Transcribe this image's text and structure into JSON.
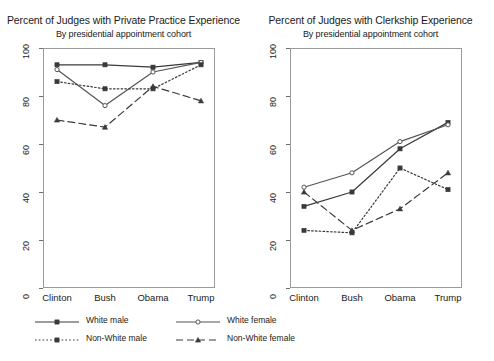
{
  "figure": {
    "panels": [
      {
        "id": "private-practice",
        "title": "Percent of Judges with Private Practice Experience",
        "subtitle": "By presidential appointment cohort"
      },
      {
        "id": "clerkship",
        "title": "Percent of Judges with Clerkship Experience",
        "subtitle": "By presidential appointment cohort"
      }
    ],
    "legend": {
      "entries": [
        {
          "label": "White male",
          "marker": "filled-square",
          "line": "solid",
          "color": "#3a3a3a"
        },
        {
          "label": "White female",
          "marker": "open-circle",
          "line": "solid",
          "color": "#5a5a5a"
        },
        {
          "label": "Non-White male",
          "marker": "filled-square",
          "line": "dotted",
          "color": "#3a3a3a"
        },
        {
          "label": "Non-White female",
          "marker": "filled-triangle",
          "line": "dashed",
          "color": "#3a3a3a"
        }
      ]
    }
  },
  "axes": {
    "y_ticks": [
      "0",
      "20",
      "40",
      "60",
      "80",
      "100"
    ],
    "x_ticks": [
      "Clinton",
      "Bush",
      "Obama",
      "Trump"
    ],
    "ylim": [
      0,
      100
    ]
  },
  "chart_data": [
    {
      "type": "line",
      "title": "Percent of Judges with Private Practice Experience",
      "subtitle": "By presidential appointment cohort",
      "xlabel": "",
      "ylabel": "",
      "categories": [
        "Clinton",
        "Bush",
        "Obama",
        "Trump"
      ],
      "ylim": [
        0,
        100
      ],
      "grid": false,
      "legend_position": "bottom",
      "series": [
        {
          "name": "White male",
          "values": [
            93,
            93,
            92,
            94
          ]
        },
        {
          "name": "White female",
          "values": [
            91,
            76,
            90,
            94
          ]
        },
        {
          "name": "Non-White male",
          "values": [
            86,
            83,
            83,
            93
          ]
        },
        {
          "name": "Non-White female",
          "values": [
            70,
            67,
            84,
            78
          ]
        }
      ]
    },
    {
      "type": "line",
      "title": "Percent of Judges with Clerkship Experience",
      "subtitle": "By presidential appointment cohort",
      "xlabel": "",
      "ylabel": "",
      "categories": [
        "Clinton",
        "Bush",
        "Obama",
        "Trump"
      ],
      "ylim": [
        0,
        100
      ],
      "grid": false,
      "legend_position": "bottom",
      "series": [
        {
          "name": "White male",
          "values": [
            34,
            40,
            58,
            69
          ]
        },
        {
          "name": "White female",
          "values": [
            42,
            48,
            61,
            68
          ]
        },
        {
          "name": "Non-White male",
          "values": [
            24,
            23,
            50,
            41
          ]
        },
        {
          "name": "Non-White female",
          "values": [
            40,
            24,
            33,
            48
          ]
        }
      ]
    }
  ]
}
